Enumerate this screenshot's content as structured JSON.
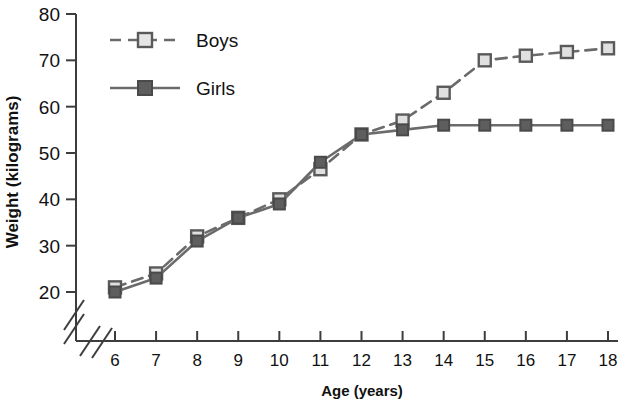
{
  "chart_data": {
    "type": "line",
    "title": "",
    "xlabel": "Age (years)",
    "ylabel": "Weight (kilograms)",
    "x": [
      6,
      7,
      8,
      9,
      10,
      11,
      12,
      13,
      14,
      15,
      16,
      17,
      18
    ],
    "xtick_labels": [
      "6",
      "7",
      "8",
      "9",
      "10",
      "11",
      "12",
      "13",
      "14",
      "15",
      "16",
      "17",
      "18"
    ],
    "ytick_labels": [
      "20",
      "30",
      "40",
      "50",
      "60",
      "70",
      "80"
    ],
    "ytick_values": [
      20,
      30,
      40,
      50,
      60,
      70,
      80
    ],
    "ylim": [
      17,
      80
    ],
    "xlim": [
      5.5,
      18.5
    ],
    "grid": false,
    "axis_break_x": true,
    "axis_break_y": true,
    "legend_position": "top-left",
    "series": [
      {
        "name": "Boys",
        "values": [
          21,
          24,
          32,
          36,
          40,
          46.5,
          54,
          57,
          63,
          70,
          71,
          71.8,
          72.6
        ],
        "color": "#6b6b6b",
        "marker": "open-square",
        "marker_fill": "#e0e0e0",
        "linestyle": "dashed"
      },
      {
        "name": "Girls",
        "values": [
          20,
          23,
          31,
          36,
          39,
          48,
          54,
          55,
          56,
          56,
          56,
          56,
          56
        ],
        "color": "#6b6b6b",
        "marker": "filled-square",
        "marker_fill": "#5e5e5e",
        "linestyle": "solid"
      }
    ]
  },
  "legend": {
    "entries": [
      {
        "label": "Boys"
      },
      {
        "label": "Girls"
      }
    ]
  },
  "colors": {
    "axis": "#3d3d3d",
    "text": "#111111",
    "series_line": "#6b6b6b",
    "boys_marker_fill": "#e6e6e6",
    "girls_marker_fill": "#5e5e5e",
    "marker_stroke": "#5a5a5a"
  }
}
